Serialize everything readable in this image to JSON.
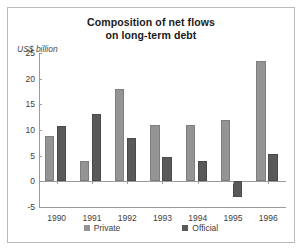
{
  "chart_data": {
    "type": "bar",
    "title": "Composition of net flows on long-term debt",
    "title_line1": "Composition of net flows",
    "title_line2": "on long-term debt",
    "ylabel": "US$ billion",
    "xlabel": "",
    "ylim": [
      -5,
      25
    ],
    "yticks": [
      25,
      20,
      15,
      10,
      5,
      0,
      -5
    ],
    "ytick_labels": [
      "25",
      "20",
      "15",
      "10",
      "5",
      "0",
      "-5"
    ],
    "grid": false,
    "legend_position": "bottom",
    "categories": [
      "1990",
      "1991",
      "1992",
      "1993",
      "1994",
      "1995",
      "1996"
    ],
    "series": [
      {
        "name": "Private",
        "color": "#949494",
        "values": [
          8.9,
          4.0,
          18.0,
          11.0,
          11.0,
          12.0,
          23.5
        ]
      },
      {
        "name": "Official",
        "color": "#595959",
        "values": [
          10.8,
          13.2,
          8.5,
          4.8,
          4.0,
          -3.0,
          5.3
        ]
      }
    ]
  },
  "legend": {
    "items": [
      {
        "label": "Private"
      },
      {
        "label": "Official"
      }
    ]
  }
}
